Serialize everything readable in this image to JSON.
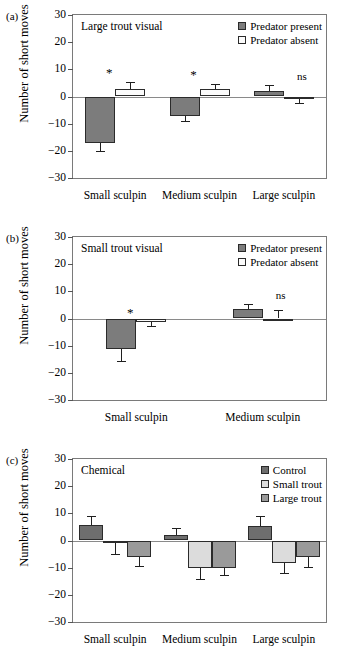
{
  "figure": {
    "ylabel": "Number of short moves",
    "y_ticks": [
      "30",
      "20",
      "10",
      "0",
      "−10",
      "−20",
      "−30"
    ]
  },
  "panels": [
    {
      "letter": "(a)",
      "title": "Large trout visual",
      "legend": [
        {
          "label": "Predator present",
          "color": "#7c7c7c"
        },
        {
          "label": "Predator absent",
          "color": "#fbfbfb"
        }
      ],
      "categories": [
        "Small sculpin",
        "Medium sculpin",
        "Large sculpin"
      ],
      "annotations": [
        "*",
        "*",
        "ns"
      ]
    },
    {
      "letter": "(b)",
      "title": "Small trout visual",
      "legend": [
        {
          "label": "Predator present",
          "color": "#7c7c7c"
        },
        {
          "label": "Predator absent",
          "color": "#fbfbfb"
        }
      ],
      "categories": [
        "Small sculpin",
        "Medium sculpin"
      ],
      "annotations": [
        "*",
        "ns"
      ]
    },
    {
      "letter": "(c)",
      "title": "Chemical",
      "legend": [
        {
          "label": "Control",
          "color": "#6e6e6e"
        },
        {
          "label": "Small trout",
          "color": "#dcdcdc"
        },
        {
          "label": "Large trout",
          "color": "#9a9a9a"
        }
      ],
      "categories": [
        "Small sculpin",
        "Medium sculpin",
        "Large sculpin"
      ],
      "annotations": [
        "",
        "",
        ""
      ]
    }
  ],
  "chart_data": [
    {
      "type": "bar",
      "panel": "(a)",
      "title": "Large trout visual",
      "xlabel": "",
      "ylabel": "Number of short moves",
      "ylim": [
        -30,
        30
      ],
      "yticks": [
        -30,
        -20,
        -10,
        0,
        10,
        20,
        30
      ],
      "grid": false,
      "legend_position": "top-right",
      "categories": [
        "Small sculpin",
        "Medium sculpin",
        "Large sculpin"
      ],
      "series": [
        {
          "name": "Predator present",
          "color": "#7c7c7c",
          "values": [
            -17,
            -7,
            2
          ],
          "errors": [
            3.2,
            2.2,
            2.2
          ]
        },
        {
          "name": "Predator absent",
          "color": "#fbfbfb",
          "values": [
            2.6,
            2.6,
            -1
          ],
          "errors": [
            2.6,
            2.1,
            1.3
          ]
        }
      ],
      "annotations": [
        {
          "category": "Small sculpin",
          "text": "*"
        },
        {
          "category": "Medium sculpin",
          "text": "*"
        },
        {
          "category": "Large sculpin",
          "text": "ns"
        }
      ]
    },
    {
      "type": "bar",
      "panel": "(b)",
      "title": "Small trout visual",
      "xlabel": "",
      "ylabel": "Number of short moves",
      "ylim": [
        -30,
        30
      ],
      "yticks": [
        -30,
        -20,
        -10,
        0,
        10,
        20,
        30
      ],
      "grid": false,
      "legend_position": "top-right",
      "categories": [
        "Small sculpin",
        "Medium sculpin"
      ],
      "series": [
        {
          "name": "Predator present",
          "color": "#7c7c7c",
          "values": [
            -11.2,
            3.5
          ],
          "errors": [
            4.5,
            1.9
          ]
        },
        {
          "name": "Predator absent",
          "color": "#fbfbfb",
          "values": [
            -1.3,
            0
          ],
          "errors": [
            1.5,
            3.2
          ]
        }
      ],
      "annotations": [
        {
          "category": "Small sculpin",
          "text": "*"
        },
        {
          "category": "Medium sculpin",
          "text": "ns"
        }
      ]
    },
    {
      "type": "bar",
      "panel": "(c)",
      "title": "Chemical",
      "xlabel": "",
      "ylabel": "Number of short moves",
      "ylim": [
        -30,
        30
      ],
      "yticks": [
        -30,
        -20,
        -10,
        0,
        10,
        20,
        30
      ],
      "grid": false,
      "legend_position": "top-right",
      "categories": [
        "Small sculpin",
        "Medium sculpin",
        "Large sculpin"
      ],
      "series": [
        {
          "name": "Control",
          "color": "#6e6e6e",
          "values": [
            5.7,
            2.2,
            5.3
          ],
          "errors": [
            3.3,
            2.3,
            3.8
          ]
        },
        {
          "name": "Small trout",
          "color": "#dcdcdc",
          "values": [
            -1,
            -10.2,
            -8.1
          ],
          "errors": [
            3.8,
            3.8,
            3.8
          ]
        },
        {
          "name": "Large trout",
          "color": "#9a9a9a",
          "values": [
            -6,
            -10.2,
            -6
          ],
          "errors": [
            3.4,
            2.5,
            3.6
          ]
        }
      ],
      "annotations": []
    }
  ]
}
